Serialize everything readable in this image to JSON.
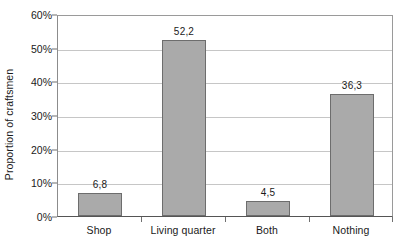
{
  "chart_data": {
    "type": "bar",
    "title": "",
    "subtitle": "",
    "xlabel": "",
    "ylabel": "Proportion of craftsmen",
    "categories": [
      "Shop",
      "Living quarter",
      "Both",
      "Nothing"
    ],
    "values": [
      6.8,
      52.2,
      4.5,
      36.3
    ],
    "value_labels": [
      "6,8",
      "52,2",
      "4,5",
      "36,3"
    ],
    "ylim": [
      0,
      60
    ],
    "ytick_values": [
      0,
      10,
      20,
      30,
      40,
      50,
      60
    ],
    "ytick_labels": [
      "0%",
      "10%",
      "20%",
      "30%",
      "40%",
      "50%",
      "60%"
    ],
    "grid": "horizontal",
    "legend": "none",
    "bar_fill_color": "#aaaaaa",
    "bar_border_color": "#6d6d6d",
    "gridline_color": "#c6c6c6",
    "axis_color": "#555555",
    "text_color": "#1a1a1a"
  }
}
